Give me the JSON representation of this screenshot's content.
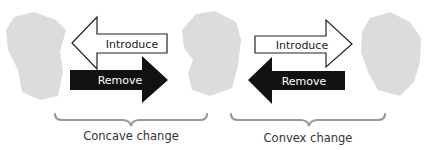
{
  "diagram": {
    "shapes": [
      {
        "id": "left-shape",
        "kind": "concave",
        "fill": "#dcdcdc"
      },
      {
        "id": "middle-shape",
        "kind": "concave",
        "fill": "#dcdcdc"
      },
      {
        "id": "right-shape",
        "kind": "convex",
        "fill": "#dcdcdc"
      }
    ],
    "arrows": {
      "left_introduce": {
        "label": "Introduce",
        "direction": "left",
        "style": "outline"
      },
      "left_remove": {
        "label": "Remove",
        "direction": "right",
        "style": "filled"
      },
      "right_introduce": {
        "label": "Introduce",
        "direction": "right",
        "style": "outline"
      },
      "right_remove": {
        "label": "Remove",
        "direction": "left",
        "style": "filled"
      }
    },
    "groups": [
      {
        "label": "Concave change"
      },
      {
        "label": "Convex change"
      }
    ],
    "colors": {
      "shape_fill": "#dcdcdc",
      "arrow_dark": "#111111",
      "arrow_outline": "#222222",
      "brace": "#999999",
      "caption_text": "#333333"
    }
  }
}
